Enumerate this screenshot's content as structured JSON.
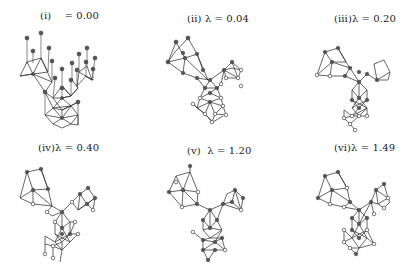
{
  "figure": {
    "panels": [
      {
        "id": "i",
        "label": "(i)    = 0.00",
        "roman": "(i)",
        "lambda": "0.00"
      },
      {
        "id": "ii",
        "label": "(ii) λ = 0.04",
        "roman": "(ii)",
        "lambda": "0.04"
      },
      {
        "id": "iii",
        "label": "(iii)λ = 0.20",
        "roman": "(iii)",
        "lambda": "0.20"
      },
      {
        "id": "iv",
        "label": "(iv)λ = 0.40",
        "roman": "(iv)",
        "lambda": "0.40"
      },
      {
        "id": "v",
        "label": "(v)  λ = 1.20",
        "roman": "(v)",
        "lambda": "1.20"
      },
      {
        "id": "vi",
        "label": "(vi)λ = 1.49",
        "roman": "(vi)",
        "lambda": "1.49"
      }
    ],
    "colors": {
      "edge": "#333333",
      "node_filled": "#555555",
      "node_hollow": "#ffffff",
      "background": "#ffffff"
    }
  }
}
